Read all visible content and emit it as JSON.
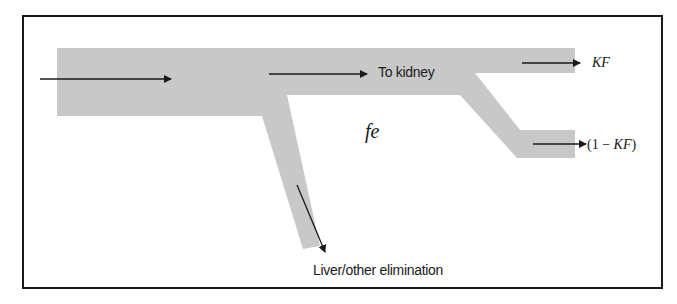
{
  "diagram": {
    "type": "flow-schematic",
    "labels": {
      "to_kidney": "To kidney",
      "kf": "KF",
      "one_minus_kf_open": "(1 − ",
      "one_minus_kf_var": "KF",
      "one_minus_kf_close": ")",
      "fe": "fe",
      "liver": "Liver/other elimination"
    },
    "colors": {
      "channel": "#c8c8c8",
      "arrow": "#1a1a1a",
      "frame": "#1a1a1a",
      "background": "#ffffff"
    }
  }
}
